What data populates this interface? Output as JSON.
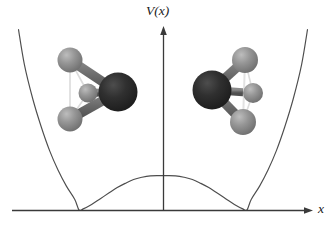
{
  "figure": {
    "title": "",
    "kind": "double-well-potential-diagram",
    "background_color": "#ffffff"
  },
  "axes": {
    "y_label": "V(x)",
    "x_label": "x",
    "axis_color": "#3a3a3a",
    "x_axis_y": 210,
    "y_axis_x": 163,
    "x_axis_start": 12,
    "x_axis_end": 312,
    "y_axis_top": 26
  },
  "chart_data": {
    "type": "line",
    "title": "",
    "xlabel": "x",
    "ylabel": "V(x)",
    "grid": false,
    "legend": null,
    "curve_color": "#4d4d4d",
    "series": [
      {
        "name": "V(x)",
        "minima_x": [
          -1,
          1
        ],
        "minima_y": [
          0,
          0
        ],
        "barrier_x": 0,
        "barrier_y": 0.62,
        "x": [
          -1.72,
          -1.65,
          -1.55,
          -1.45,
          -1.35,
          -1.25,
          -1.15,
          -1.05,
          -1.0,
          -0.95,
          -0.85,
          -0.75,
          -0.65,
          -0.55,
          -0.45,
          -0.35,
          -0.25,
          -0.15,
          -0.05,
          0.0,
          0.05,
          0.15,
          0.25,
          0.35,
          0.45,
          0.55,
          0.65,
          0.75,
          0.85,
          0.95,
          1.0,
          1.05,
          1.15,
          1.25,
          1.35,
          1.45,
          1.55,
          1.65,
          1.72
        ],
        "y": [
          3.25,
          2.62,
          2.0,
          1.5,
          1.07,
          0.72,
          0.43,
          0.19,
          0.0,
          0.02,
          0.1,
          0.2,
          0.3,
          0.4,
          0.48,
          0.55,
          0.59,
          0.615,
          0.62,
          0.62,
          0.62,
          0.615,
          0.59,
          0.55,
          0.48,
          0.4,
          0.3,
          0.2,
          0.1,
          0.02,
          0.0,
          0.19,
          0.43,
          0.72,
          1.07,
          1.5,
          2.0,
          2.62,
          3.25
        ]
      }
    ],
    "xlim": [
      -1.72,
      1.72
    ],
    "ylim": [
      0,
      3.3
    ]
  },
  "molecules": {
    "atom_colors": {
      "nitrogen": "#2b2b2b",
      "nitrogen_highlight": "#4a4a4a",
      "hydrogen": "#8e8e8e",
      "hydrogen_highlight": "#c2c2c2",
      "bond": "#6d6d6d"
    },
    "left": {
      "name": "ammonia-left-configuration",
      "label": "NH3 umbrella pointing left",
      "atoms": [
        {
          "element": "N",
          "cx": 118,
          "cy": 92,
          "r": 19.5
        },
        {
          "element": "H",
          "cx": 70,
          "cy": 60,
          "r": 12.5
        },
        {
          "element": "H",
          "cx": 88,
          "cy": 93,
          "r": 9.5
        },
        {
          "element": "H",
          "cx": 70,
          "cy": 119,
          "r": 12.5
        }
      ]
    },
    "right": {
      "name": "ammonia-right-configuration",
      "label": "NH3 umbrella pointing right",
      "atoms": [
        {
          "element": "N",
          "cx": 212,
          "cy": 90,
          "r": 19.5
        },
        {
          "element": "H",
          "cx": 245,
          "cy": 60,
          "r": 13.0
        },
        {
          "element": "H",
          "cx": 253,
          "cy": 93,
          "r": 10.0
        },
        {
          "element": "H",
          "cx": 243,
          "cy": 122,
          "r": 13.0
        }
      ]
    }
  }
}
